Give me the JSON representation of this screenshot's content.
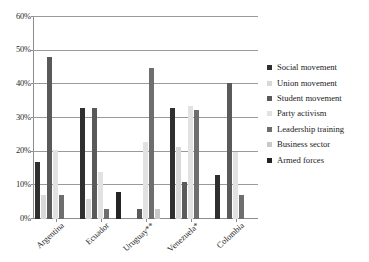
{
  "chart_data": {
    "type": "bar",
    "title": "",
    "xlabel": "",
    "ylabel": "",
    "ylim": [
      0,
      60
    ],
    "ytick_labels": [
      "0%",
      "10%",
      "20%",
      "30%",
      "40%",
      "50%",
      "60%"
    ],
    "ytick_values": [
      0,
      10,
      20,
      30,
      40,
      50,
      60
    ],
    "grid": true,
    "legend_position": "right",
    "categories": [
      "Argentina",
      "Ecuador",
      "Uruguay**",
      "Venezuela*",
      "Colombia"
    ],
    "series": [
      {
        "name": "Social movement",
        "color": "#2f2f2f",
        "values": [
          17,
          33,
          null,
          33,
          13
        ]
      },
      {
        "name": "Union movement",
        "color": "#d8d8d8",
        "values": [
          7,
          6,
          null,
          21.5,
          null
        ]
      },
      {
        "name": "Student movement",
        "color": "#5a5a5a",
        "values": [
          48,
          33,
          3,
          11,
          40.5
        ]
      },
      {
        "name": "Party activism",
        "color": "#e2e2e2",
        "values": [
          20.5,
          14,
          23,
          33.5,
          20
        ]
      },
      {
        "name": "Leadership training",
        "color": "#6e6e6e",
        "values": [
          7,
          3,
          45,
          32.5,
          7
        ]
      },
      {
        "name": "Business sector",
        "color": "#c9c9c9",
        "values": [
          null,
          null,
          3,
          null,
          null
        ]
      },
      {
        "name": "Armed forces",
        "color": "#242424",
        "values": [
          null,
          8,
          null,
          null,
          null
        ]
      }
    ]
  }
}
